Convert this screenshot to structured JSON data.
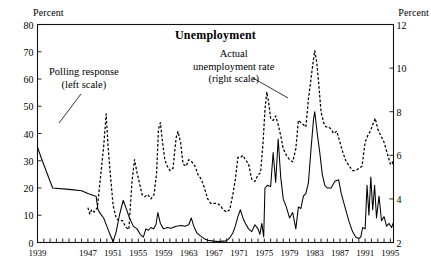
{
  "chart_data": {
    "type": "line",
    "title": "Unemployment",
    "xlabel": "",
    "ylabel": "Percent",
    "ylabel_right": "Percent",
    "ylim": [
      0,
      80
    ],
    "ylim_right": [
      2,
      12
    ],
    "grid": false,
    "legend_position": "inline-annotations",
    "x_tick_labels": [
      "1939",
      "1947",
      "1951",
      "1955",
      "1959",
      "1963",
      "1967",
      "1971",
      "1975",
      "1979",
      "1983",
      "1987",
      "1991",
      "1995"
    ],
    "x_tick_values": [
      1939,
      1947,
      1951,
      1955,
      1959,
      1963,
      1967,
      1971,
      1975,
      1979,
      1983,
      1987,
      1991,
      1995
    ],
    "y_tick_labels_left": [
      "80",
      "70",
      "60",
      "50",
      "40",
      "30",
      "20",
      "10",
      "0"
    ],
    "y_tick_values_left": [
      80,
      70,
      60,
      50,
      40,
      30,
      20,
      10,
      0
    ],
    "y_tick_labels_right": [
      "12",
      "10",
      "8",
      "6",
      "4",
      "2"
    ],
    "y_tick_values_right": [
      12,
      10,
      8,
      6,
      4,
      2
    ],
    "xlim": [
      1939,
      1995.5
    ],
    "annotations": [
      {
        "name": "polling-response",
        "text_line1": "Polling response",
        "text_line2": "(left scale)"
      },
      {
        "name": "actual-unemployment",
        "text_line1": "Actual",
        "text_line2": "unemployment rate",
        "text_line3": "(right scale)"
      }
    ],
    "series": [
      {
        "name": "Polling response (left scale)",
        "axis": "left",
        "style": "solid",
        "points": [
          [
            1939.0,
            35.0
          ],
          [
            1939.6,
            31.0
          ],
          [
            1941.4,
            20.0
          ],
          [
            1944.0,
            19.5
          ],
          [
            1946.0,
            19.0
          ],
          [
            1947.0,
            18.0
          ],
          [
            1948.0,
            17.2
          ],
          [
            1948.3,
            17.0
          ],
          [
            1948.6,
            12.0
          ],
          [
            1949.0,
            10.5
          ],
          [
            1949.5,
            9.0
          ],
          [
            1950.0,
            6.0
          ],
          [
            1950.5,
            3.0
          ],
          [
            1951.0,
            0.3
          ],
          [
            1951.5,
            4.0
          ],
          [
            1952.0,
            10.0
          ],
          [
            1952.6,
            15.5
          ],
          [
            1953.0,
            13.0
          ],
          [
            1953.6,
            9.0
          ],
          [
            1954.2,
            6.0
          ],
          [
            1954.8,
            5.0
          ],
          [
            1955.3,
            3.0
          ],
          [
            1955.8,
            2.0
          ],
          [
            1956.2,
            5.0
          ],
          [
            1956.6,
            4.5
          ],
          [
            1957.0,
            5.5
          ],
          [
            1957.4,
            5.0
          ],
          [
            1957.8,
            6.5
          ],
          [
            1958.1,
            11.0
          ],
          [
            1958.5,
            7.0
          ],
          [
            1959.0,
            5.0
          ],
          [
            1959.6,
            5.5
          ],
          [
            1960.2,
            5.2
          ],
          [
            1961.0,
            6.0
          ],
          [
            1961.8,
            6.2
          ],
          [
            1962.4,
            6.0
          ],
          [
            1963.0,
            6.5
          ],
          [
            1963.4,
            9.0
          ],
          [
            1963.8,
            6.0
          ],
          [
            1964.3,
            3.5
          ],
          [
            1964.8,
            2.5
          ],
          [
            1965.4,
            1.5
          ],
          [
            1966.0,
            0.8
          ],
          [
            1967.0,
            0.5
          ],
          [
            1967.8,
            0.4
          ],
          [
            1968.4,
            0.5
          ],
          [
            1969.0,
            0.6
          ],
          [
            1969.6,
            2.0
          ],
          [
            1970.0,
            3.5
          ],
          [
            1970.4,
            6.0
          ],
          [
            1970.8,
            9.5
          ],
          [
            1971.2,
            12.0
          ],
          [
            1971.6,
            9.0
          ],
          [
            1972.0,
            7.0
          ],
          [
            1972.5,
            5.0
          ],
          [
            1973.0,
            4.0
          ],
          [
            1973.5,
            6.5
          ],
          [
            1974.0,
            5.0
          ],
          [
            1974.3,
            3.0
          ],
          [
            1974.6,
            7.0
          ],
          [
            1974.9,
            2.0
          ],
          [
            1975.1,
            20.0
          ],
          [
            1975.5,
            21.0
          ],
          [
            1976.0,
            20.5
          ],
          [
            1976.4,
            33.0
          ],
          [
            1976.8,
            22.0
          ],
          [
            1977.2,
            38.0
          ],
          [
            1977.6,
            24.0
          ],
          [
            1978.0,
            16.0
          ],
          [
            1978.5,
            13.0
          ],
          [
            1979.0,
            9.0
          ],
          [
            1979.5,
            11.0
          ],
          [
            1980.0,
            5.0
          ],
          [
            1980.4,
            13.0
          ],
          [
            1980.8,
            12.5
          ],
          [
            1981.2,
            17.0
          ],
          [
            1981.6,
            18.0
          ],
          [
            1982.0,
            22.0
          ],
          [
            1982.4,
            34.0
          ],
          [
            1982.8,
            45.0
          ],
          [
            1983.0,
            48.0
          ],
          [
            1983.4,
            40.0
          ],
          [
            1983.8,
            33.0
          ],
          [
            1984.2,
            25.0
          ],
          [
            1984.6,
            21.0
          ],
          [
            1985.0,
            20.0
          ],
          [
            1985.6,
            20.0
          ],
          [
            1986.2,
            22.5
          ],
          [
            1986.8,
            23.0
          ],
          [
            1987.2,
            18.0
          ],
          [
            1987.8,
            13.0
          ],
          [
            1988.4,
            8.0
          ],
          [
            1989.0,
            4.0
          ],
          [
            1989.5,
            2.0
          ],
          [
            1990.0,
            1.5
          ],
          [
            1990.3,
            2.0
          ],
          [
            1990.6,
            5.5
          ],
          [
            1991.0,
            5.0
          ],
          [
            1991.3,
            21.0
          ],
          [
            1991.6,
            10.0
          ],
          [
            1991.9,
            24.0
          ],
          [
            1992.2,
            12.0
          ],
          [
            1992.5,
            21.0
          ],
          [
            1992.8,
            9.0
          ],
          [
            1993.2,
            17.0
          ],
          [
            1993.6,
            8.0
          ],
          [
            1994.0,
            9.5
          ],
          [
            1994.4,
            6.0
          ],
          [
            1994.8,
            7.0
          ],
          [
            1995.2,
            5.5
          ],
          [
            1995.5,
            7.5
          ]
        ]
      },
      {
        "name": "Actual unemployment rate (right scale)",
        "axis": "right",
        "style": "dashed",
        "points": [
          [
            1947.0,
            3.6
          ],
          [
            1947.3,
            3.3
          ],
          [
            1947.6,
            3.5
          ],
          [
            1948.0,
            3.4
          ],
          [
            1948.5,
            3.6
          ],
          [
            1949.0,
            5.0
          ],
          [
            1949.5,
            6.4
          ],
          [
            1949.9,
            7.9
          ],
          [
            1950.2,
            6.4
          ],
          [
            1950.6,
            5.0
          ],
          [
            1951.0,
            3.7
          ],
          [
            1951.5,
            3.1
          ],
          [
            1952.0,
            3.0
          ],
          [
            1952.5,
            3.0
          ],
          [
            1953.0,
            2.7
          ],
          [
            1953.5,
            2.6
          ],
          [
            1954.0,
            4.8
          ],
          [
            1954.4,
            5.8
          ],
          [
            1954.8,
            5.2
          ],
          [
            1955.2,
            4.7
          ],
          [
            1955.6,
            4.2
          ],
          [
            1956.0,
            4.1
          ],
          [
            1956.5,
            4.2
          ],
          [
            1957.0,
            4.0
          ],
          [
            1957.5,
            4.2
          ],
          [
            1957.9,
            5.2
          ],
          [
            1958.2,
            7.2
          ],
          [
            1958.5,
            7.5
          ],
          [
            1958.8,
            6.7
          ],
          [
            1959.2,
            5.8
          ],
          [
            1959.6,
            5.5
          ],
          [
            1960.0,
            5.3
          ],
          [
            1960.5,
            5.4
          ],
          [
            1961.0,
            6.8
          ],
          [
            1961.3,
            7.1
          ],
          [
            1961.7,
            6.6
          ],
          [
            1962.1,
            5.6
          ],
          [
            1962.6,
            5.5
          ],
          [
            1963.0,
            5.8
          ],
          [
            1963.5,
            5.7
          ],
          [
            1964.0,
            5.5
          ],
          [
            1964.5,
            5.1
          ],
          [
            1965.0,
            4.9
          ],
          [
            1965.5,
            4.5
          ],
          [
            1966.0,
            4.0
          ],
          [
            1966.5,
            3.8
          ],
          [
            1967.0,
            3.8
          ],
          [
            1967.5,
            3.8
          ],
          [
            1968.0,
            3.7
          ],
          [
            1968.5,
            3.5
          ],
          [
            1969.0,
            3.4
          ],
          [
            1969.5,
            3.5
          ],
          [
            1970.0,
            4.2
          ],
          [
            1970.4,
            4.9
          ],
          [
            1970.8,
            5.9
          ],
          [
            1971.2,
            5.9
          ],
          [
            1971.6,
            6.0
          ],
          [
            1972.0,
            5.8
          ],
          [
            1972.5,
            5.6
          ],
          [
            1973.0,
            4.9
          ],
          [
            1973.5,
            4.8
          ],
          [
            1974.0,
            5.1
          ],
          [
            1974.4,
            5.2
          ],
          [
            1974.8,
            6.6
          ],
          [
            1975.1,
            8.1
          ],
          [
            1975.4,
            8.9
          ],
          [
            1975.7,
            8.4
          ],
          [
            1976.0,
            7.7
          ],
          [
            1976.4,
            7.6
          ],
          [
            1976.8,
            7.8
          ],
          [
            1977.2,
            7.4
          ],
          [
            1977.6,
            6.9
          ],
          [
            1978.0,
            6.3
          ],
          [
            1978.5,
            6.0
          ],
          [
            1979.0,
            5.8
          ],
          [
            1979.5,
            5.7
          ],
          [
            1980.0,
            6.3
          ],
          [
            1980.4,
            7.6
          ],
          [
            1980.8,
            7.5
          ],
          [
            1981.2,
            7.4
          ],
          [
            1981.6,
            7.3
          ],
          [
            1982.0,
            8.6
          ],
          [
            1982.4,
            9.5
          ],
          [
            1982.8,
            10.4
          ],
          [
            1983.0,
            10.8
          ],
          [
            1983.3,
            10.3
          ],
          [
            1983.6,
            9.4
          ],
          [
            1984.0,
            8.0
          ],
          [
            1984.4,
            7.5
          ],
          [
            1984.8,
            7.3
          ],
          [
            1985.2,
            7.3
          ],
          [
            1985.6,
            7.2
          ],
          [
            1986.0,
            7.0
          ],
          [
            1986.5,
            7.1
          ],
          [
            1987.0,
            6.6
          ],
          [
            1987.5,
            6.1
          ],
          [
            1988.0,
            5.7
          ],
          [
            1988.5,
            5.5
          ],
          [
            1989.0,
            5.3
          ],
          [
            1989.5,
            5.3
          ],
          [
            1990.0,
            5.4
          ],
          [
            1990.5,
            5.5
          ],
          [
            1991.0,
            6.6
          ],
          [
            1991.4,
            6.9
          ],
          [
            1991.8,
            7.1
          ],
          [
            1992.2,
            7.4
          ],
          [
            1992.6,
            7.7
          ],
          [
            1993.0,
            7.2
          ],
          [
            1993.5,
            6.9
          ],
          [
            1994.0,
            6.6
          ],
          [
            1994.5,
            6.1
          ],
          [
            1995.0,
            5.6
          ],
          [
            1995.3,
            5.7
          ],
          [
            1995.5,
            5.5
          ]
        ]
      }
    ]
  }
}
